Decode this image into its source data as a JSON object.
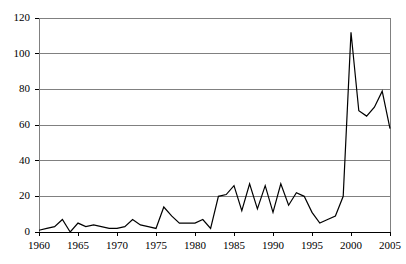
{
  "chart_data": {
    "type": "line",
    "title": "",
    "xlabel": "",
    "ylabel": "",
    "xlim": [
      1960,
      2005
    ],
    "ylim": [
      0,
      120
    ],
    "grid": true,
    "legend": null,
    "yticks": [
      0,
      20,
      40,
      60,
      80,
      100,
      120
    ],
    "ytick_labels": [
      "0",
      "20",
      "40",
      "60",
      "80",
      "100",
      "120"
    ],
    "xticks": [
      1960,
      1965,
      1970,
      1975,
      1980,
      1985,
      1990,
      1995,
      2000,
      2005
    ],
    "xtick_labels": [
      "1960",
      "1965",
      "1970",
      "1975",
      "1980",
      "1985",
      "1990",
      "1995",
      "2000",
      "2005"
    ],
    "line_color": "#000000",
    "grid_color": "#808080",
    "axis_color": "#808080",
    "x": [
      1960,
      1961,
      1962,
      1963,
      1964,
      1965,
      1966,
      1967,
      1968,
      1969,
      1970,
      1971,
      1972,
      1973,
      1974,
      1975,
      1976,
      1977,
      1978,
      1979,
      1980,
      1981,
      1982,
      1983,
      1984,
      1985,
      1986,
      1987,
      1988,
      1989,
      1990,
      1991,
      1992,
      1993,
      1994,
      1995,
      1996,
      1997,
      1998,
      1999,
      2000,
      2001,
      2002,
      2003,
      2004,
      2005
    ],
    "y": [
      1,
      2,
      3,
      7,
      0,
      5,
      3,
      4,
      3,
      2,
      2,
      3,
      7,
      4,
      3,
      2,
      14,
      9,
      5,
      5,
      5,
      7,
      2,
      20,
      21,
      26,
      12,
      27,
      13,
      26,
      11,
      27,
      15,
      22,
      20,
      11,
      5,
      7,
      9,
      20,
      112,
      68,
      65,
      70,
      79,
      58
    ],
    "series": [
      {
        "name": "value",
        "values": [
          1,
          2,
          3,
          7,
          0,
          5,
          3,
          4,
          3,
          2,
          2,
          3,
          7,
          4,
          3,
          2,
          14,
          9,
          5,
          5,
          5,
          7,
          2,
          20,
          21,
          26,
          12,
          27,
          13,
          26,
          11,
          27,
          15,
          22,
          20,
          11,
          5,
          7,
          9,
          20,
          112,
          68,
          65,
          70,
          79,
          58
        ]
      }
    ]
  },
  "geometry": {
    "plot_left": 39,
    "plot_right": 390,
    "plot_top": 18,
    "plot_bottom": 232
  }
}
